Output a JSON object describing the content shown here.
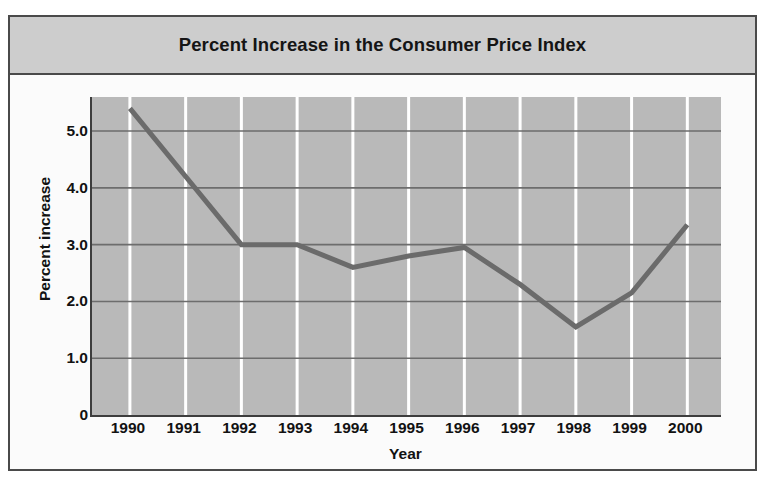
{
  "chart_data": {
    "type": "line",
    "title": "Percent Increase in the Consumer Price Index",
    "xlabel": "Year",
    "ylabel": "Percent increase",
    "categories": [
      "1990",
      "1991",
      "1992",
      "1993",
      "1994",
      "1995",
      "1996",
      "1997",
      "1998",
      "1999",
      "2000"
    ],
    "values": [
      5.4,
      4.2,
      3.0,
      3.0,
      2.6,
      2.8,
      2.95,
      2.3,
      1.55,
      2.15,
      3.35
    ],
    "ylim": [
      0,
      5.6
    ],
    "yticks": [
      "0",
      "1.0",
      "2.0",
      "3.0",
      "4.0",
      "5.0"
    ],
    "ytick_values": [
      0,
      1.0,
      2.0,
      3.0,
      4.0,
      5.0
    ],
    "grid": "horizontal dark rules at each y tick; vertical white rules at each year",
    "legend": "none",
    "series": [
      {
        "name": "Percent increase in CPI",
        "values": [
          5.4,
          4.2,
          3.0,
          3.0,
          2.6,
          2.8,
          2.95,
          2.3,
          1.55,
          2.15,
          3.35
        ]
      }
    ],
    "colors": {
      "line": "#6b6b6b",
      "plot_background": "#b9b9b9",
      "title_background": "#cdcdcd",
      "gridline_vertical": "#ffffff",
      "gridline_horizontal": "#6d6d6d",
      "axis": "#3d3d3d",
      "text": "#121212"
    }
  }
}
